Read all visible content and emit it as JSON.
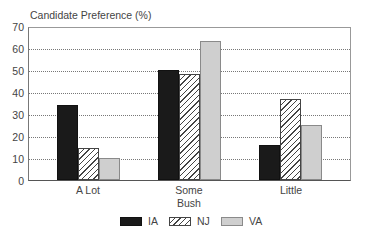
{
  "chart_data": {
    "type": "bar",
    "title": "Candidate Preference (%)",
    "xlabel": "Bush",
    "ylabel": "Candidate Preference (%)",
    "categories": [
      "A Lot",
      "Some",
      "Little"
    ],
    "series": [
      {
        "name": "IA",
        "values": [
          34,
          50,
          16
        ],
        "color": "#1a1a1a",
        "pattern": "solid"
      },
      {
        "name": "NJ",
        "values": [
          14.5,
          48,
          37
        ],
        "color": "#ffffff",
        "pattern": "diagonal-hatch"
      },
      {
        "name": "VA",
        "values": [
          10,
          63,
          25
        ],
        "color": "#cfcfcf",
        "pattern": "solid"
      }
    ],
    "ylim": [
      0,
      70
    ],
    "yticks": [
      0,
      10,
      20,
      30,
      40,
      50,
      60,
      70
    ],
    "grid": "horizontal dotted",
    "legend_position": "bottom"
  },
  "ui": {
    "title": "Candidate Preference (%)",
    "xtitle": "Bush",
    "yticks": [
      "0",
      "10",
      "20",
      "30",
      "40",
      "50",
      "60",
      "70"
    ],
    "categories": [
      "A Lot",
      "Some",
      "Little"
    ],
    "legend": [
      "IA",
      "NJ",
      "VA"
    ]
  }
}
